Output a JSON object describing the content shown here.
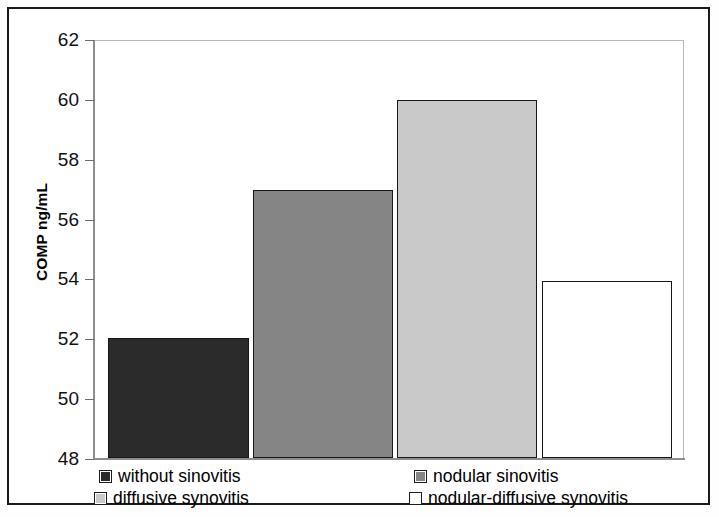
{
  "chart_data": {
    "type": "bar",
    "title": "",
    "subtitle": "",
    "xlabel": "",
    "ylabel": "COMP ng/mL",
    "ylabel_parts": {
      "bold": "COMP",
      "plain": " ng/mL"
    },
    "ylim": [
      48,
      62
    ],
    "ytick_labels": [
      "62",
      "60",
      "58",
      "56",
      "54",
      "52",
      "50",
      "48"
    ],
    "ytick_values": [
      62,
      60,
      58,
      56,
      54,
      52,
      50,
      48
    ],
    "grid": false,
    "legend_position": "bottom",
    "categories": [
      "without sinovitis",
      "nodular sinovitis",
      "diffusive synovitis",
      "nodular-diffusive synovitis"
    ],
    "values": [
      52.0,
      56.95,
      59.95,
      53.9
    ],
    "bar_colors": [
      "#2b2b2b",
      "#858585",
      "#c9c9c9",
      "#ffffff"
    ],
    "bar_edge_color": "#171717",
    "series": [
      {
        "name": "COMP ng/mL",
        "values": [
          52.0,
          56.95,
          59.95,
          53.9
        ]
      }
    ],
    "bars": [
      {
        "label": "without sinovitis",
        "value": 52.0,
        "color": "#2b2b2b"
      },
      {
        "label": "nodular sinovitis",
        "value": 56.95,
        "color": "#858585"
      },
      {
        "label": "diffusive synovitis",
        "value": 59.95,
        "color": "#c9c9c9"
      },
      {
        "label": "nodular-diffusive synovitis",
        "value": 53.9,
        "color": "#ffffff"
      }
    ]
  },
  "legend": {
    "items": [
      {
        "label": "without sinovitis",
        "color": "#2b2b2b"
      },
      {
        "label": "nodular sinovitis",
        "color": "#858585"
      },
      {
        "label": "diffusive synovitis",
        "color": "#c9c9c9"
      },
      {
        "label": "nodular-diffusive synovitis",
        "color": "#ffffff"
      }
    ]
  },
  "colors": {
    "frame": "#1a1a1a",
    "axis": "#8d8d8d",
    "plot_border": "#b9b9b9",
    "background": "#ffffff"
  }
}
